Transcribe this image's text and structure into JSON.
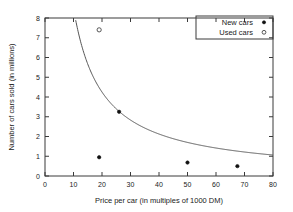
{
  "chart_data": {
    "type": "scatter",
    "title": "",
    "xlabel": "Price per car (in multiples of 1000 DM)",
    "ylabel": "Number of cars sold (in millions)",
    "xlim": [
      0,
      80
    ],
    "ylim": [
      0,
      8
    ],
    "xticks": [
      0,
      10,
      20,
      30,
      40,
      50,
      60,
      70,
      80
    ],
    "yticks": [
      0,
      1,
      2,
      3,
      4,
      5,
      6,
      7,
      8
    ],
    "grid": false,
    "legend_position": "top-right",
    "series": [
      {
        "name": "New cars",
        "marker": "filled-dot",
        "color": "#111111",
        "points": [
          {
            "x": 19.0,
            "y": 0.95
          },
          {
            "x": 26.0,
            "y": 3.25
          },
          {
            "x": 50.0,
            "y": 0.68
          },
          {
            "x": 67.5,
            "y": 0.5
          }
        ]
      },
      {
        "name": "Used cars",
        "marker": "open-circle",
        "color": "#555555",
        "points": [
          {
            "x": 19.0,
            "y": 7.4
          }
        ]
      }
    ],
    "fit_curve": {
      "name": "hyperbolic fit",
      "equation": "y = 85 / x",
      "color": "#555555",
      "x_start": 10.6,
      "x_end": 80
    }
  },
  "legend": {
    "entries": [
      {
        "label": "New cars",
        "marker": "filled-dot"
      },
      {
        "label": "Used cars",
        "marker": "open-circle"
      }
    ]
  },
  "axes": {
    "x_tick_labels": [
      "0",
      "10",
      "20",
      "30",
      "40",
      "50",
      "60",
      "70",
      "80"
    ],
    "y_tick_labels": [
      "0",
      "1",
      "2",
      "3",
      "4",
      "5",
      "6",
      "7",
      "8"
    ],
    "x_title": "Price per car (in multiples of 1000 DM)",
    "y_title": "Number of cars sold (in millions)"
  }
}
